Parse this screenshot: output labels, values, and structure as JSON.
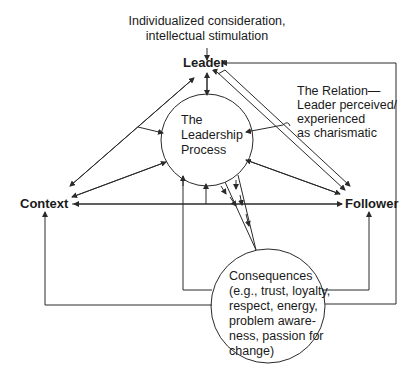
{
  "top_note": {
    "line1": "Individualized consideration,",
    "line2": "intellectual stimulation"
  },
  "nodes": {
    "leader": "Leader",
    "context": "Context",
    "follower": "Follower"
  },
  "process": {
    "line1": "The",
    "line2": "Leadership",
    "line3": "Process"
  },
  "relation": {
    "line1": "The Relation—",
    "line2": "Leader perceived/",
    "line3": "experienced",
    "line4": "as charismatic"
  },
  "consequences": {
    "line1": "Consequences",
    "line2": "(e.g., trust, loyalty,",
    "line3": "respect, energy,",
    "line4": "problem aware-",
    "line5": "ness, passion for",
    "line6": "change)"
  },
  "colors": {
    "line": "#2a2a2a",
    "text": "#1a1a1a",
    "background": "#ffffff"
  }
}
